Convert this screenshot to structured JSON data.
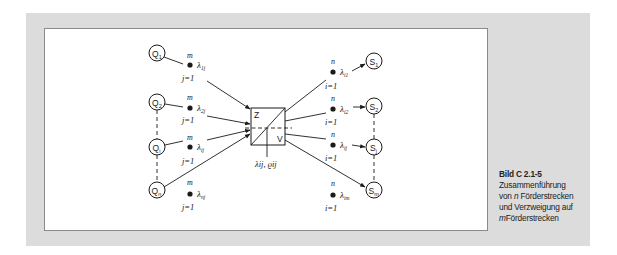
{
  "figure": {
    "caption": {
      "title": "Bild C 2.1-5",
      "line1": "Zusammenführung",
      "line2_prefix": "von ",
      "line2_var": "n",
      "line2_suffix": " Förderstrecken",
      "line3": "und Verzweigung auf",
      "line4_var": "m",
      "line4_suffix": "Förderstrecken"
    },
    "colors": {
      "panel": "#dcdcdc",
      "box": "#ffffff",
      "ink": "#1a1a1a"
    },
    "center_node": {
      "merge_label": "Z",
      "branch_label": "V",
      "flow_label": "λij, ϱij"
    },
    "sources": [
      {
        "label": "Q",
        "sub": "1",
        "sum_top": "m",
        "lambda": "λ",
        "lambda_sub": "1j",
        "sum_bottom": "j=1"
      },
      {
        "label": "Q",
        "sub": "2",
        "sum_top": "m",
        "lambda": "λ",
        "lambda_sub": "2j",
        "sum_bottom": "j=1"
      },
      {
        "label": "Q",
        "sub": "i",
        "sum_top": "m",
        "lambda": "λ",
        "lambda_sub": "ij",
        "sum_bottom": "j=1"
      },
      {
        "label": "Q",
        "sub": "n",
        "sum_top": "m",
        "lambda": "λ",
        "lambda_sub": "nj",
        "sum_bottom": "j=1"
      }
    ],
    "sinks": [
      {
        "label": "S",
        "sub": "1",
        "sum_top": "n",
        "lambda": "λ",
        "lambda_sub": "i1",
        "sum_bottom": "i=1"
      },
      {
        "label": "S",
        "sub": "2",
        "sum_top": "n",
        "lambda": "λ",
        "lambda_sub": "i2",
        "sum_bottom": "i=1"
      },
      {
        "label": "S",
        "sub": "j",
        "sum_top": "n",
        "lambda": "λ",
        "lambda_sub": "ij",
        "sum_bottom": "i=1"
      },
      {
        "label": "S",
        "sub": "m",
        "sum_top": "n",
        "lambda": "λ",
        "lambda_sub": "im",
        "sum_bottom": "i=1"
      }
    ]
  }
}
